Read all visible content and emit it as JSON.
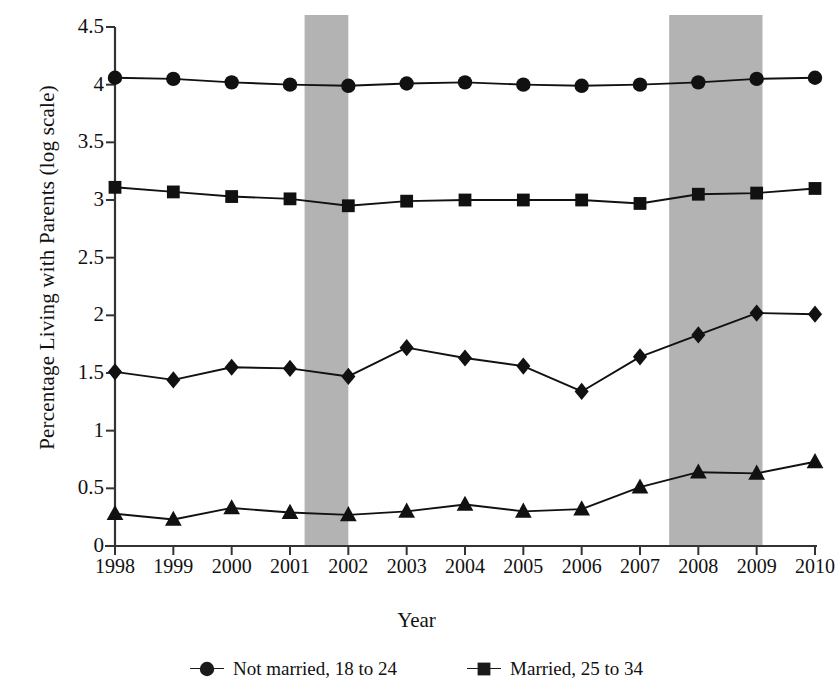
{
  "chart_data": {
    "type": "line",
    "title": "",
    "xlabel": "Year",
    "ylabel": "Percentage Living with Parents (log scale)",
    "categories": [
      1998,
      1999,
      2000,
      2001,
      2002,
      2003,
      2004,
      2005,
      2006,
      2007,
      2008,
      2009,
      2010
    ],
    "x_tick_labels": [
      "1998",
      "1999",
      "2000",
      "2001",
      "2002",
      "2003",
      "2004",
      "2005",
      "2006",
      "2007",
      "2008",
      "2009",
      "2010"
    ],
    "y_tick_labels": [
      "0",
      "0.5",
      "1",
      "1.5",
      "2",
      "2.5",
      "3",
      "3.5",
      "4",
      "4.5"
    ],
    "y_ticks": [
      0,
      0.5,
      1,
      1.5,
      2,
      2.5,
      3,
      3.5,
      4,
      4.5
    ],
    "ylim": [
      0,
      4.5
    ],
    "xlim": [
      1998,
      2010
    ],
    "grid": false,
    "legend_position": "bottom",
    "series": [
      {
        "name": "Not married, 18 to 24",
        "marker": "circle",
        "color": "#111111",
        "values": [
          4.06,
          4.05,
          4.02,
          4.0,
          3.99,
          4.01,
          4.02,
          4.0,
          3.99,
          4.0,
          4.02,
          4.05,
          4.06
        ]
      },
      {
        "name": "Married, 25 to 34",
        "marker": "square",
        "color": "#111111",
        "values": [
          3.11,
          3.07,
          3.03,
          3.01,
          2.95,
          2.99,
          3.0,
          3.0,
          3.0,
          2.97,
          3.05,
          3.06,
          3.1
        ]
      },
      {
        "name": "Not married, 25 to 34",
        "marker": "diamond",
        "color": "#111111",
        "values": [
          1.51,
          1.44,
          1.55,
          1.54,
          1.47,
          1.72,
          1.63,
          1.56,
          1.34,
          1.64,
          1.83,
          2.02,
          2.01
        ]
      },
      {
        "name": "Married, 18 to 24",
        "marker": "triangle",
        "color": "#111111",
        "values": [
          0.28,
          0.23,
          0.33,
          0.29,
          0.27,
          0.3,
          0.36,
          0.3,
          0.32,
          0.51,
          0.64,
          0.63,
          0.73
        ]
      }
    ],
    "shaded_bands": [
      {
        "label": "recession-band-2001",
        "x_start": 2001.25,
        "x_end": 2002.0,
        "color": "#b3b3b3"
      },
      {
        "label": "recession-band-2008",
        "x_start": 2007.5,
        "x_end": 2009.1,
        "color": "#b3b3b3"
      }
    ]
  },
  "axes": {
    "y_title": "Percentage Living with Parents (log scale)",
    "x_title": "Year"
  },
  "legend": {
    "entries": [
      {
        "label": "Not married, 18 to 24",
        "marker": "circle"
      },
      {
        "label": "Married, 25 to 34",
        "marker": "square"
      }
    ]
  },
  "style": {
    "axis_color": "#333333",
    "line_color": "#1a1a1a",
    "band_color": "#b3b3b3",
    "background": "#ffffff"
  }
}
